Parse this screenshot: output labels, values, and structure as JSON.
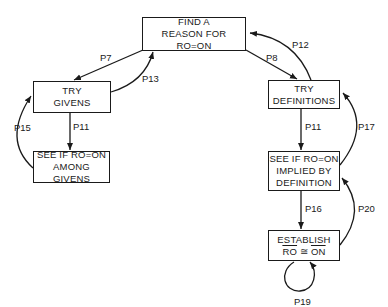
{
  "nodes": {
    "find_reason": {
      "line1": "FIND A",
      "line2": "REASON FOR  RO=ON"
    },
    "try_givens": {
      "line1": "TRY",
      "line2": "GIVENS"
    },
    "see_givens": {
      "line1": "SEE IF RO=ON",
      "line2": "AMONG GIVENS"
    },
    "try_definitions": {
      "line1": "TRY",
      "line2": "DEFINITIONS"
    },
    "see_implied": {
      "line1": "SEE IF RO=ON",
      "line2": "IMPLIED BY",
      "line3": "DEFINITION"
    },
    "establish": {
      "line1": "ESTABLISH",
      "ro": "RO",
      "rel": " ≅ ",
      "on": "ON"
    }
  },
  "edges": {
    "p7": "P7",
    "p13": "P13",
    "p15": "P15",
    "p11_left": "P11",
    "p8": "P8",
    "p12": "P12",
    "p11_right": "P11",
    "p17": "P17",
    "p16": "P16",
    "p20": "P20",
    "p19": "P19"
  }
}
